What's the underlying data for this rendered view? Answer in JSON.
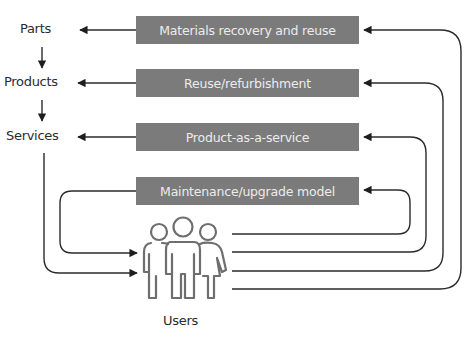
{
  "diagram": {
    "outputs": [
      {
        "id": "parts",
        "label": "Parts"
      },
      {
        "id": "products",
        "label": "Products"
      },
      {
        "id": "services",
        "label": "Services"
      }
    ],
    "models": [
      {
        "id": "materials-recovery",
        "label": "Materials recovery and reuse",
        "feeds": "Parts"
      },
      {
        "id": "reuse-refurbishment",
        "label": "Reuse/refurbishment",
        "feeds": "Products"
      },
      {
        "id": "product-as-a-service",
        "label": "Product-as-a-service",
        "feeds": "Services"
      },
      {
        "id": "maintenance-upgrade",
        "label": "Maintenance/upgrade model",
        "feeds": "Users"
      }
    ],
    "users": {
      "label": "Users",
      "icon": "people-group-icon"
    },
    "colors": {
      "box_fill": "#7b7b7b",
      "box_text": "#ececec",
      "line": "#2b2b2b",
      "icon_stroke": "#6e6e6e"
    }
  }
}
